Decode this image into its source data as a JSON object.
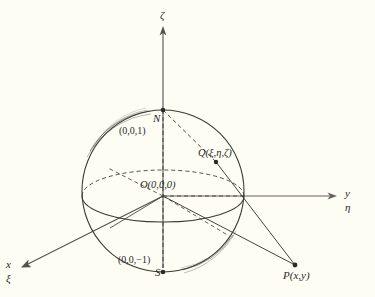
{
  "figure": {
    "kind": "stereographic-projection-riemann-sphere",
    "background_color": "#fdfdf4",
    "stroke_color": "#3a3a36",
    "axis_color": "#55514f"
  },
  "axes": {
    "vertical": {
      "label": "ζ",
      "name": "zeta-axis"
    },
    "right": {
      "label_top": "y",
      "label_bottom": "η",
      "name": "y-eta-axis"
    },
    "lower_left": {
      "label_top": "x",
      "label_bottom": "ξ",
      "name": "x-xi-axis"
    }
  },
  "points": {
    "north_pole": {
      "label": "N",
      "coords": "(0,0,1)"
    },
    "south_pole": {
      "label": "S",
      "coords": "(0,0,−1)"
    },
    "origin": {
      "label": "O(0,0,0)"
    },
    "sphere_point": {
      "label": "Q(ξ,η,ζ)"
    },
    "plane_point": {
      "label": "P(x,y)"
    }
  }
}
